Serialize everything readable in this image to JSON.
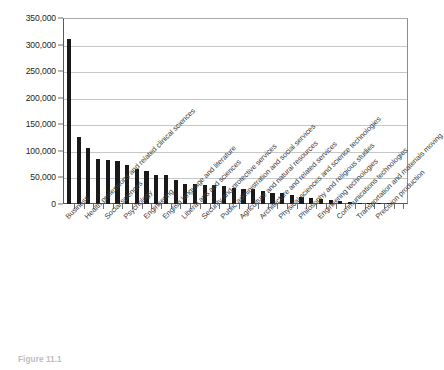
{
  "caption": "Figure 11.1",
  "chart_data": {
    "type": "bar",
    "title": "",
    "subtitle": "",
    "xlabel": "",
    "ylabel": "",
    "ylim": [
      0,
      350000
    ],
    "ytick_step": 50000,
    "grid": true,
    "legend": false,
    "bar_color": "#1a1a1a",
    "gridline_color": "#c6c7c9",
    "axis_color": "#58595b",
    "ytick_labels": [
      "0",
      "50,000",
      "100,000",
      "150,000",
      "200,000",
      "250,000",
      "300,000",
      "350,000"
    ],
    "ytick_values": [
      0,
      50000,
      100000,
      150000,
      200000,
      250000,
      300000,
      350000
    ],
    "categories": [
      "Business",
      "Education",
      "Health professions and related clinical sciences",
      "Visual and performing arts",
      "Social sciences",
      "Journalism and communications",
      "Psychology",
      "Biological and biomedical sciences",
      "Engineering",
      "Computer and information sciences",
      "English language and literature",
      "History",
      "Liberal arts and sciences",
      "Interdisciplinary studies",
      "Security and protective services",
      "Parks, recreation, leisure, and fitness studies",
      "Public administration and social services",
      "Family and consumer sciences",
      "Agriculture and natural resources",
      "Foreign languages and linguistics",
      "Architecture and related services",
      "Mathematics and statistics",
      "Physical sciences and science technologies",
      "Theology and religious vocations",
      "Philosophy and religious studies",
      "Area, ethnic, cultural, and gender studies",
      "Engineering technologies",
      "Legal professions and studies",
      "Communications technologies",
      "Mechanics and repair technologies",
      "Transportation and materials moving",
      "Library science",
      "Precision production",
      "Military technologies"
    ],
    "labeled_categories": [
      "Business",
      "Education",
      "Visual and performing arts",
      "Journalism and communications",
      "Biological and biomedical sciences",
      "Computer and information sciences",
      "History",
      "Interdisciplinary studies",
      "Parks, recreation, leisure, and fitness studies",
      "Family and consumer sciences",
      "Foreign languages and linguistics",
      "Mathematics and statistics",
      "Theology and religious vocations",
      "Area, ethnic, cultural, and gender studies",
      "Legal professions and studies",
      "Mechanics and repair technologies",
      "Library science",
      "Military technologies"
    ],
    "values": [
      310000,
      126000,
      105000,
      85000,
      82000,
      81000,
      73000,
      65000,
      63000,
      55000,
      55000,
      46000,
      38000,
      37000,
      36000,
      35000,
      33000,
      31000,
      29000,
      28000,
      24000,
      21000,
      20000,
      17000,
      14000,
      11000,
      9000,
      7000,
      5000,
      4000,
      2500,
      1200,
      900,
      400
    ]
  }
}
